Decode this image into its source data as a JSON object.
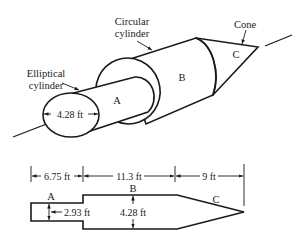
{
  "figure": {
    "type": "engineering-diagram",
    "isometric_view": {
      "labels": {
        "elliptical_line1": "Elliptical",
        "elliptical_line2": "cylinder",
        "circular_line1": "Circular",
        "circular_line2": "cylinder",
        "cone": "Cone"
      },
      "parts": {
        "a": "A",
        "b": "B",
        "c": "C"
      },
      "ellipse_dimension": "4.28 ft"
    },
    "side_view": {
      "dimensions": {
        "length_a": "6.75 ft",
        "length_b": "11.3 ft",
        "length_c": "9 ft",
        "height_a": "2.93 ft",
        "height_b": "4.28 ft"
      },
      "parts": {
        "a": "A",
        "b": "B",
        "c": "C"
      }
    }
  }
}
